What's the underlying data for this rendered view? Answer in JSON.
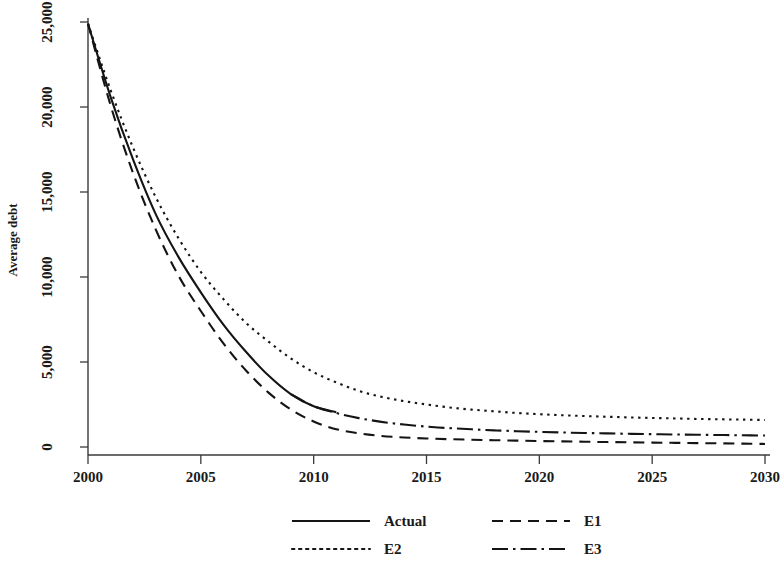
{
  "chart_data": {
    "type": "line",
    "title": "",
    "xlabel": "",
    "ylabel": "Average debt",
    "xlim": [
      2000,
      2030
    ],
    "ylim": [
      0,
      25000
    ],
    "grid": false,
    "legend_position": "bottom",
    "x_ticks": [
      "2000",
      "2005",
      "2010",
      "2015",
      "2020",
      "2025",
      "2030"
    ],
    "x_tick_values": [
      2000,
      2005,
      2010,
      2015,
      2020,
      2025,
      2030
    ],
    "y_ticks": [
      "0",
      "5,000",
      "10,000",
      "15,000",
      "20,000",
      "25,000"
    ],
    "y_tick_values": [
      0,
      5000,
      10000,
      15000,
      20000,
      25000
    ],
    "x": [
      2000,
      2001,
      2002,
      2003,
      2004,
      2005,
      2006,
      2007,
      2008,
      2009,
      2010,
      2011,
      2012,
      2013,
      2014,
      2015,
      2016,
      2017,
      2018,
      2019,
      2020,
      2021,
      2022,
      2023,
      2024,
      2025,
      2026,
      2027,
      2028,
      2029,
      2030
    ],
    "series": [
      {
        "name": "Actual",
        "style": "solid",
        "color": "#141414",
        "x": [
          2000,
          2001,
          2002,
          2003,
          2004,
          2005,
          2006,
          2007,
          2008,
          2009,
          2010,
          2011
        ],
        "values": [
          24900,
          20600,
          16900,
          13700,
          11200,
          9100,
          7200,
          5600,
          4200,
          3100,
          2400,
          2050
        ]
      },
      {
        "name": "E1",
        "style": "dashed",
        "color": "#141414",
        "x": [
          2000,
          2001,
          2002,
          2003,
          2004,
          2005,
          2006,
          2007,
          2008,
          2009,
          2010,
          2011,
          2012,
          2013,
          2014,
          2015,
          2016,
          2017,
          2018,
          2019,
          2020,
          2021,
          2022,
          2023,
          2024,
          2025,
          2026,
          2027,
          2028,
          2029,
          2030
        ],
        "values": [
          24900,
          20100,
          16100,
          12800,
          10100,
          8000,
          6100,
          4500,
          3200,
          2200,
          1500,
          1050,
          800,
          650,
          560,
          500,
          460,
          430,
          400,
          375,
          350,
          330,
          310,
          290,
          275,
          260,
          245,
          230,
          215,
          200,
          180
        ]
      },
      {
        "name": "E2",
        "style": "dotted",
        "color": "#141414",
        "x": [
          2000,
          2001,
          2002,
          2003,
          2004,
          2005,
          2006,
          2007,
          2008,
          2009,
          2010,
          2011,
          2012,
          2013,
          2014,
          2015,
          2016,
          2017,
          2018,
          2019,
          2020,
          2021,
          2022,
          2023,
          2024,
          2025,
          2026,
          2027,
          2028,
          2029,
          2030
        ],
        "values": [
          24900,
          21000,
          17600,
          14700,
          12300,
          10300,
          8700,
          7300,
          6200,
          5200,
          4400,
          3800,
          3300,
          2950,
          2700,
          2500,
          2330,
          2200,
          2100,
          2000,
          1930,
          1870,
          1820,
          1780,
          1740,
          1710,
          1680,
          1650,
          1630,
          1610,
          1590
        ]
      },
      {
        "name": "E3",
        "style": "dash-dot",
        "color": "#141414",
        "x": [
          2009,
          2010,
          2011,
          2012,
          2013,
          2014,
          2015,
          2016,
          2017,
          2018,
          2019,
          2020,
          2021,
          2022,
          2023,
          2024,
          2025,
          2026,
          2027,
          2028,
          2029,
          2030
        ],
        "values": [
          3100,
          2400,
          2000,
          1700,
          1480,
          1320,
          1200,
          1110,
          1040,
          980,
          930,
          890,
          855,
          825,
          800,
          775,
          755,
          735,
          720,
          705,
          690,
          675
        ]
      }
    ],
    "legend": [
      {
        "label": "Actual",
        "style": "solid"
      },
      {
        "label": "E1",
        "style": "dashed"
      },
      {
        "label": "E2",
        "style": "dotted"
      },
      {
        "label": "E3",
        "style": "dash-dot"
      }
    ]
  }
}
